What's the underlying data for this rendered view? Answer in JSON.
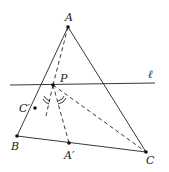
{
  "diagram": {
    "labels": {
      "A": "A",
      "B": "B",
      "C": "C",
      "P": "P",
      "A_prime": "A′",
      "C_prime": "C′",
      "line_l": "ℓ"
    },
    "points": {
      "A": [
        68,
        27
      ],
      "B": [
        17,
        136
      ],
      "C": [
        146,
        152
      ],
      "P": [
        53,
        85
      ],
      "A_prime": [
        69,
        143
      ],
      "C_prime": [
        35,
        108
      ]
    },
    "line_l": [
      [
        10,
        85
      ],
      [
        155,
        83
      ]
    ],
    "stroke_color": "#222222"
  }
}
